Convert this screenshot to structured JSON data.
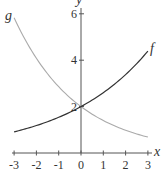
{
  "chart_data": {
    "type": "line",
    "title": "",
    "xlabel": "x",
    "ylabel": "y",
    "xlim": [
      -3,
      3
    ],
    "ylim": [
      0,
      6
    ],
    "grid": false,
    "legend": "inline labels at curve ends",
    "x_ticks": [
      "-3",
      "-2",
      "-1",
      "0",
      "1",
      "2",
      "3"
    ],
    "y_ticks": [
      "2",
      "4",
      "6"
    ],
    "x": [
      -3,
      -2,
      -1,
      0,
      1,
      2,
      3
    ],
    "series": [
      {
        "name": "f",
        "color": "#333333",
        "formula": "2*(1.3)^x",
        "values": [
          0.91,
          1.18,
          1.54,
          2.0,
          2.6,
          3.38,
          4.39
        ]
      },
      {
        "name": "g",
        "color": "#aaaaaa",
        "formula": "2*(0.7)^x",
        "values": [
          5.83,
          4.08,
          2.86,
          2.0,
          1.4,
          0.98,
          0.69
        ]
      }
    ],
    "annotations": [
      {
        "text": "f",
        "near": "end of f curve, x=3"
      },
      {
        "text": "g",
        "near": "start of g curve, x=-3"
      }
    ]
  }
}
